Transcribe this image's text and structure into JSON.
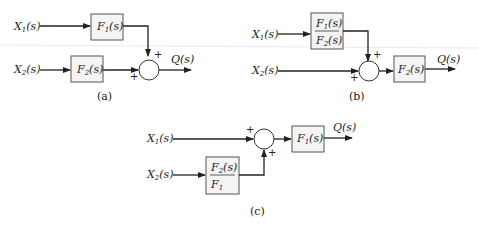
{
  "diagrams": [
    {
      "id": "a",
      "caption": "(a)",
      "inputs": [
        "X1(s)",
        "X2(s)"
      ],
      "blocks": [
        {
          "label": "F1(s)"
        },
        {
          "label": "F2(s)"
        }
      ],
      "summing_junction": {
        "signs": [
          "+",
          "+"
        ]
      },
      "output": "Q(s)"
    },
    {
      "id": "b",
      "caption": "(b)",
      "inputs": [
        "X1(s)",
        "X2(s)"
      ],
      "blocks": [
        {
          "numerator": "F1(s)",
          "denominator": "F2(s)"
        },
        {
          "label": "F2(s)"
        }
      ],
      "summing_junction": {
        "signs": [
          "+",
          "+"
        ]
      },
      "output": "Q(s)"
    },
    {
      "id": "c",
      "caption": "(c)",
      "inputs": [
        "X1(s)",
        "X2(s)"
      ],
      "blocks": [
        {
          "numerator": "F2(s)",
          "denominator": "F1(s)"
        },
        {
          "label": "F1(s)"
        }
      ],
      "summing_junction": {
        "signs": [
          "+",
          "+"
        ]
      },
      "output": "Q(s)"
    }
  ],
  "text": {
    "X": "X",
    "F": "F",
    "Q": "Q(s)",
    "s": "(s)",
    "sub1": "1",
    "sub2": "2",
    "plus": "+",
    "cap_a": "(a)",
    "cap_b": "(b)",
    "cap_c": "(c)"
  }
}
